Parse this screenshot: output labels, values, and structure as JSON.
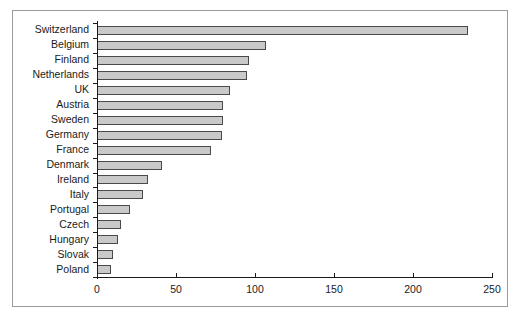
{
  "chart_data": {
    "type": "bar",
    "orientation": "horizontal",
    "title": "",
    "subtitle": "",
    "xlabel": "",
    "ylabel": "",
    "grid": false,
    "legend": false,
    "legend_position": "none",
    "xlim": [
      0,
      250
    ],
    "xticks": [
      0,
      50,
      100,
      150,
      200,
      250
    ],
    "xtick_labels": [
      "0",
      "50",
      "100",
      "150",
      "200",
      "250"
    ],
    "categories": [
      "Switzerland",
      "Belgium",
      "Finland",
      "Netherlands",
      "UK",
      "Austria",
      "Sweden",
      "Germany",
      "France",
      "Denmark",
      "Ireland",
      "Italy",
      "Portugal",
      "Czech",
      "Hungary",
      "Slovak",
      "Poland"
    ],
    "values": [
      235,
      107,
      96,
      95,
      84,
      80,
      80,
      79,
      72,
      41,
      32,
      29,
      21,
      15,
      13,
      10,
      9
    ],
    "series": [
      {
        "name": "",
        "values": [
          235,
          107,
          96,
          95,
          84,
          80,
          80,
          79,
          72,
          41,
          32,
          29,
          21,
          15,
          13,
          10,
          9
        ]
      }
    ]
  },
  "style": {
    "bar_fill": "#c9c9c9",
    "bar_border": "#4a4a4a",
    "axis_color": "#1a1a1a",
    "frame_border": "#9a9a9a",
    "background": "#ffffff",
    "text_color": "#1a1a1a"
  }
}
